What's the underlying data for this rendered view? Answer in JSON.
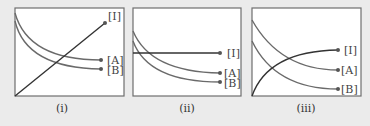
{
  "panels": [
    {
      "caption": "(i)",
      "labels": {
        "I": "[I]",
        "A": "[A]",
        "B": "[B]"
      },
      "description": "[I] increases linearly; [A] and [B] decay"
    },
    {
      "caption": "(ii)",
      "labels": {
        "I": "[I]",
        "A": "[A]",
        "B": "[B]"
      },
      "description": "[I] constant; [A] and [B] decay"
    },
    {
      "caption": "(iii)",
      "labels": {
        "I": "[I]",
        "A": "[A]",
        "B": "[B]"
      },
      "description": "[I] rises and levels off; [A] and [B] decay"
    }
  ],
  "colors": {
    "background": "#ebebeb",
    "plot_fill": "#ffffff",
    "I_line": "#333333",
    "A_B_lines": "#6a6a6a"
  }
}
